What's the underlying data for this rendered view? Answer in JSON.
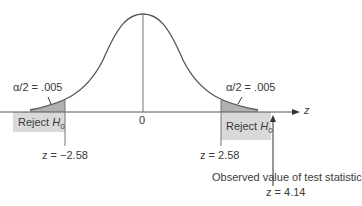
{
  "diagram": {
    "axis_label": "z",
    "center_tick": "0",
    "left_tail": {
      "alpha_label": "α/2 = .005",
      "region_label": "Reject",
      "region_symbol": "H",
      "region_sub": "0",
      "critical_label": "z = −2.58"
    },
    "right_tail": {
      "alpha_label": "α/2 = .005",
      "region_label": "Reject",
      "region_symbol": "H",
      "region_sub": "0",
      "critical_label": "z = 2.58"
    },
    "observed": {
      "caption": "Observed value of test statistic",
      "value_label": "z = 4.14"
    },
    "colors": {
      "curve": "#555555",
      "tail_fill": "#b0b0b0",
      "region_fill": "#d9d9d9",
      "axis": "#555555"
    }
  }
}
